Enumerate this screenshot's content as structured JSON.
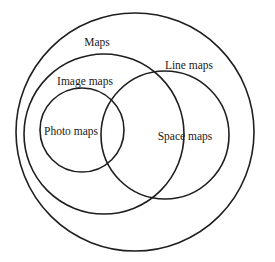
{
  "diagram": {
    "type": "venn-nested",
    "stroke_color": "#1f1f1f",
    "background": "#ffffff",
    "sets": [
      {
        "id": "maps",
        "label": "Maps",
        "cx": 135,
        "cy": 132,
        "r": 119,
        "label_x": 97,
        "label_y": 46
      },
      {
        "id": "image-maps",
        "label": "Image maps",
        "cx": 104,
        "cy": 134,
        "r": 80,
        "label_x": 85,
        "label_y": 85
      },
      {
        "id": "line-maps",
        "label": "Line maps",
        "cx": 165,
        "cy": 135,
        "r": 64,
        "label_x": 189,
        "label_y": 69
      },
      {
        "id": "photo-maps",
        "label": "Photo maps",
        "cx": 82,
        "cy": 130,
        "r": 42,
        "label_x": 71,
        "label_y": 135
      },
      {
        "id": "space-maps",
        "label": "Space maps",
        "cx": null,
        "cy": null,
        "r": null,
        "label_x": 185,
        "label_y": 140
      }
    ],
    "labels": {
      "maps": "Maps",
      "image_maps": "Image maps",
      "line_maps": "Line maps",
      "photo_maps": "Photo maps",
      "space_maps": "Space maps"
    }
  }
}
